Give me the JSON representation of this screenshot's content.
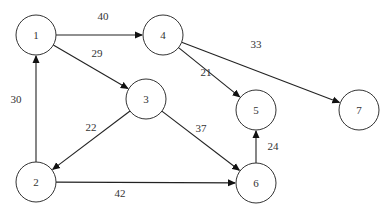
{
  "diagram": {
    "type": "directed-weighted-graph",
    "nodes": [
      {
        "id": "1",
        "label": "1",
        "x": 36,
        "y": 35
      },
      {
        "id": "2",
        "label": "2",
        "x": 36,
        "y": 182
      },
      {
        "id": "3",
        "label": "3",
        "x": 146,
        "y": 99
      },
      {
        "id": "4",
        "label": "4",
        "x": 163,
        "y": 35
      },
      {
        "id": "5",
        "label": "5",
        "x": 256,
        "y": 110
      },
      {
        "id": "6",
        "label": "6",
        "x": 256,
        "y": 183
      },
      {
        "id": "7",
        "label": "7",
        "x": 359,
        "y": 110
      }
    ],
    "edges": [
      {
        "from": "1",
        "to": "4",
        "weight": "40",
        "label_x": 103,
        "label_y": 16
      },
      {
        "from": "1",
        "to": "3",
        "weight": "29",
        "label_x": 97,
        "label_y": 53
      },
      {
        "from": "2",
        "to": "1",
        "weight": "30",
        "label_x": 16,
        "label_y": 99
      },
      {
        "from": "3",
        "to": "2",
        "weight": "22",
        "label_x": 91,
        "label_y": 127
      },
      {
        "from": "3",
        "to": "6",
        "weight": "37",
        "label_x": 201,
        "label_y": 128
      },
      {
        "from": "4",
        "to": "5",
        "weight": "21",
        "label_x": 206,
        "label_y": 72
      },
      {
        "from": "4",
        "to": "7",
        "weight": "33",
        "label_x": 256,
        "label_y": 44
      },
      {
        "from": "2",
        "to": "6",
        "weight": "42",
        "label_x": 120,
        "label_y": 193
      },
      {
        "from": "6",
        "to": "5",
        "weight": "24",
        "label_x": 273,
        "label_y": 146
      }
    ],
    "node_radius": 20,
    "colors": {
      "stroke": "#333333",
      "fill": "#ffffff",
      "text": "#333333"
    }
  }
}
